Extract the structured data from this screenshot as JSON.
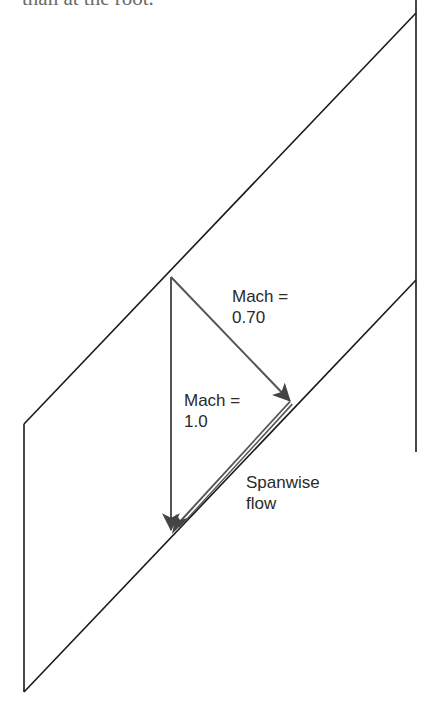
{
  "caption": {
    "text": "than at the root."
  },
  "labels": {
    "mach_freestream": {
      "line1": "Mach =",
      "line2": "0.70"
    },
    "mach_normal": {
      "line1": "Mach =",
      "line2": "1.0"
    },
    "spanwise": {
      "line1": "Spanwise",
      "line2": "flow"
    }
  },
  "colors": {
    "wing_edges": "#1a1a1a",
    "vectors": "#555555",
    "text": "#2a2a2a"
  }
}
